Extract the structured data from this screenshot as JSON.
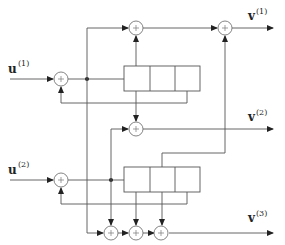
{
  "diagram": {
    "type": "rate-2/3 convolutional encoder block diagram",
    "inputs": [
      {
        "name": "u",
        "superscript": "(1)"
      },
      {
        "name": "u",
        "superscript": "(2)"
      }
    ],
    "outputs": [
      {
        "name": "v",
        "superscript": "(1)"
      },
      {
        "name": "v",
        "superscript": "(2)"
      },
      {
        "name": "v",
        "superscript": "(3)"
      }
    ],
    "adder_symbol": "+",
    "shift_registers": [
      {
        "name": "upper-register",
        "cells": 3
      },
      {
        "name": "lower-register",
        "cells": 3
      }
    ],
    "colors": {
      "line": "#555555",
      "background": "#ffffff"
    }
  }
}
